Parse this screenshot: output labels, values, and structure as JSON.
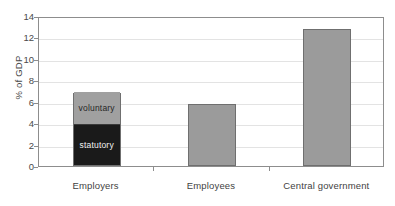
{
  "chart_data": {
    "type": "bar",
    "title": "",
    "xlabel": "",
    "ylabel": "% of GDP",
    "ylim": [
      0,
      14
    ],
    "ytick_step": 2,
    "yticks": [
      "14",
      "12",
      "10",
      "8",
      "6",
      "4",
      "2",
      "0"
    ],
    "ytick_values": [
      14,
      12,
      10,
      8,
      6,
      4,
      2,
      0
    ],
    "grid": true,
    "legend": "none",
    "categories": [
      "Employers",
      "Employees",
      "Central government"
    ],
    "stacked": true,
    "series": [
      {
        "name": "statutory",
        "values": [
          3.75,
          0,
          0
        ]
      },
      {
        "name": "voluntary",
        "values": [
          3.05,
          0,
          0
        ]
      },
      {
        "name": "total",
        "values": [
          6.8,
          5.8,
          12.8
        ]
      }
    ],
    "annotations": [
      {
        "text": "voluntary",
        "category": "Employers",
        "segment": "voluntary"
      },
      {
        "text": "statutory",
        "category": "Employers",
        "segment": "statutory"
      }
    ],
    "colors": {
      "voluntary": "#a0a0a0",
      "statutory": "#1a1a1a",
      "bar_gray": "#9b9b9b",
      "bar_outline": "#6f6f6f",
      "axis": "#8d8d8d",
      "grid": "#e3e3e3",
      "text": "#3a3a3a"
    }
  },
  "axis": {
    "y_title": "% of GDP"
  },
  "bars": {
    "employers": {
      "label": "Employers",
      "total": "6.8",
      "statutory_label": "statutory",
      "voluntary_label": "voluntary"
    },
    "employees": {
      "label": "Employees",
      "total": "5.8"
    },
    "central_government": {
      "label": "Central government",
      "total": "12.8"
    }
  }
}
